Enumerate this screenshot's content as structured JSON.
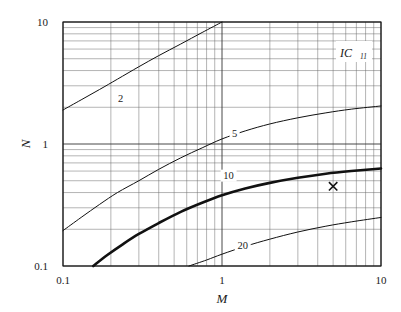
{
  "chart_data": {
    "type": "line",
    "title": "",
    "subtitle": "",
    "xlabel": "M",
    "ylabel": "N",
    "xscale": "log",
    "yscale": "log",
    "xlim": [
      0.1,
      10
    ],
    "ylim": [
      0.1,
      10
    ],
    "xticks": [
      "0.1",
      "1",
      "10"
    ],
    "yticks": [
      "0.1",
      "1",
      "10"
    ],
    "xtick_values": [
      0.1,
      1,
      10
    ],
    "ytick_values": [
      0.1,
      1,
      10
    ],
    "grid": "log-minor-both-axes",
    "legend": "inline-curve-labels",
    "corner_label": "IC",
    "corner_label_sub": "11",
    "annotations": [
      {
        "name": "operating-point",
        "marker": "x",
        "x": 5.0,
        "y": 0.45
      }
    ],
    "series": [
      {
        "name": "2",
        "label": "2",
        "label_x": 0.23,
        "label_y": 2.2,
        "emphasis": "normal",
        "points": [
          [
            0.1,
            1.9
          ],
          [
            0.13,
            2.3
          ],
          [
            0.17,
            2.8
          ],
          [
            0.22,
            3.4
          ],
          [
            0.3,
            4.3
          ],
          [
            0.4,
            5.3
          ],
          [
            0.55,
            6.6
          ],
          [
            0.75,
            8.2
          ],
          [
            1.0,
            10.0
          ]
        ]
      },
      {
        "name": "5",
        "label": "5",
        "label_x": 1.2,
        "label_y": 1.15,
        "emphasis": "normal",
        "points": [
          [
            0.1,
            0.195
          ],
          [
            0.13,
            0.25
          ],
          [
            0.17,
            0.32
          ],
          [
            0.22,
            0.4
          ],
          [
            0.3,
            0.5
          ],
          [
            0.4,
            0.62
          ],
          [
            0.55,
            0.77
          ],
          [
            0.75,
            0.93
          ],
          [
            1.0,
            1.1
          ],
          [
            1.4,
            1.28
          ],
          [
            2.0,
            1.46
          ],
          [
            3.0,
            1.64
          ],
          [
            4.5,
            1.8
          ],
          [
            6.5,
            1.93
          ],
          [
            10.0,
            2.05
          ]
        ]
      },
      {
        "name": "10",
        "label": "10",
        "label_x": 1.1,
        "label_y": 0.52,
        "emphasis": "bold",
        "points": [
          [
            0.155,
            0.1
          ],
          [
            0.19,
            0.123
          ],
          [
            0.24,
            0.152
          ],
          [
            0.3,
            0.183
          ],
          [
            0.4,
            0.225
          ],
          [
            0.55,
            0.278
          ],
          [
            0.75,
            0.33
          ],
          [
            1.0,
            0.38
          ],
          [
            1.4,
            0.432
          ],
          [
            2.0,
            0.48
          ],
          [
            3.0,
            0.528
          ],
          [
            4.5,
            0.57
          ],
          [
            6.5,
            0.6
          ],
          [
            10.0,
            0.63
          ]
        ]
      },
      {
        "name": "20",
        "label": "20",
        "label_x": 1.35,
        "label_y": 0.138,
        "emphasis": "normal",
        "points": [
          [
            0.62,
            0.1
          ],
          [
            0.8,
            0.112
          ],
          [
            1.0,
            0.125
          ],
          [
            1.4,
            0.145
          ],
          [
            2.0,
            0.166
          ],
          [
            3.0,
            0.19
          ],
          [
            4.5,
            0.212
          ],
          [
            6.5,
            0.23
          ],
          [
            10.0,
            0.25
          ]
        ]
      }
    ]
  }
}
